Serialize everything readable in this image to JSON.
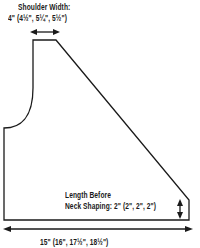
{
  "diagram": {
    "labels": {
      "shoulder_width_title": "Shoulder Width:",
      "shoulder_width_value": "4\" (4½\", 5¼\", 5½\")",
      "neck_length_line1": "Length Before",
      "neck_length_line2": "Neck Shaping:  2\" (2\", 2\", 2\")",
      "bottom_width": "15\" (16\", 17½\", 18½\")"
    },
    "colors": {
      "stroke": "#1a1a1a",
      "background": "#ffffff"
    }
  }
}
